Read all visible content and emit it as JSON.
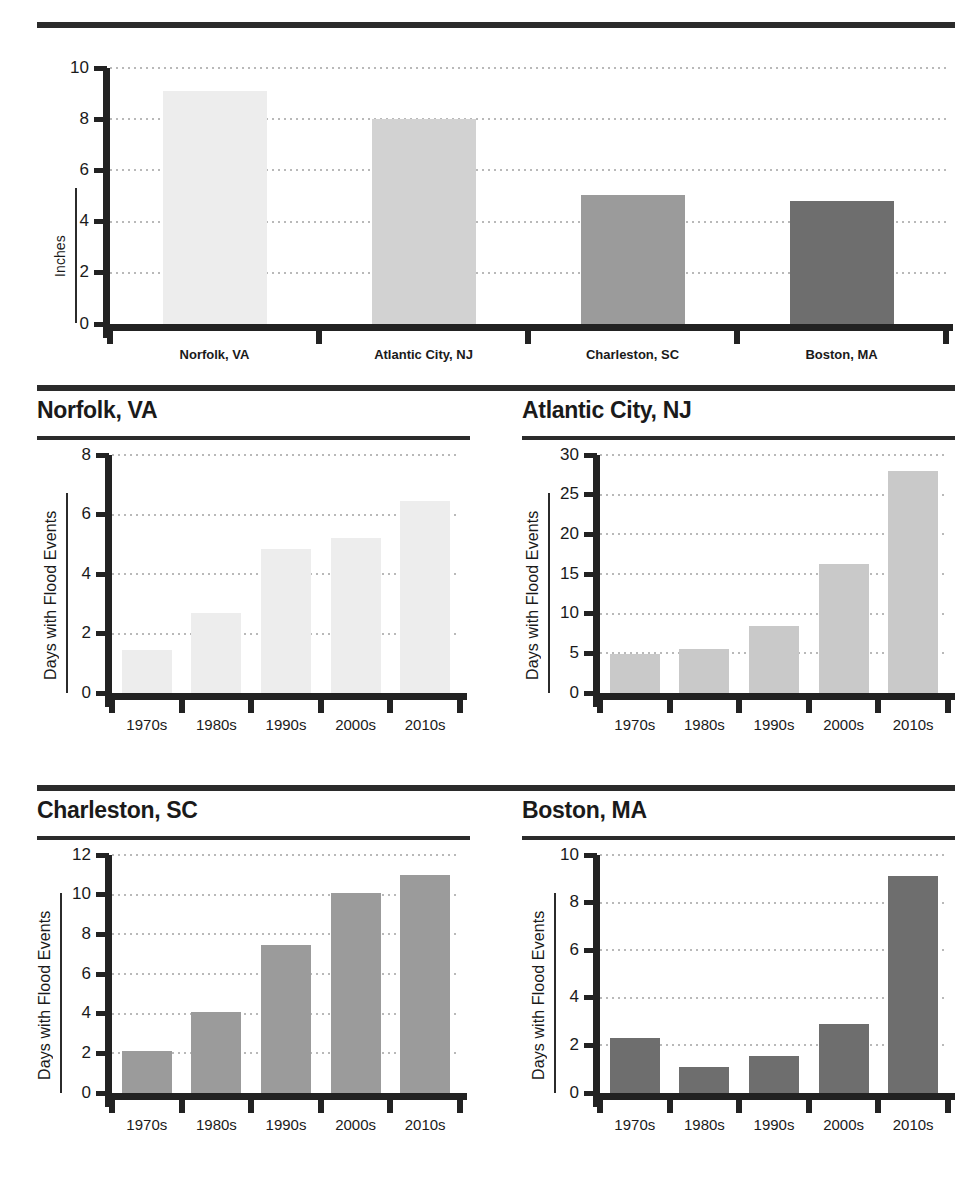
{
  "figure": {
    "top_rule_color": "#2b2b2b",
    "decade_labels": [
      "1970s",
      "1980s",
      "1990s",
      "2000s",
      "2010s"
    ],
    "axis_label_days": "Days with Flood Events",
    "axis_label_inches": "Inches"
  },
  "chart_data": [
    {
      "type": "bar",
      "title": "",
      "xlabel": "",
      "ylabel": "Inches",
      "categories": [
        "Norfolk, VA",
        "Atlantic City, NJ",
        "Charleston, SC",
        "Boston, MA"
      ],
      "values": [
        9.1,
        8.0,
        5.05,
        4.8
      ],
      "ylim": [
        0,
        10
      ],
      "yticks": [
        0,
        2,
        4,
        6,
        8,
        10
      ],
      "ytick_labels": [
        "0",
        "2",
        "4",
        "6",
        "8",
        "10"
      ],
      "colors": [
        "#ededed",
        "#d2d2d2",
        "#9b9b9b",
        "#6e6e6e"
      ],
      "grid": true,
      "legend": "none"
    },
    {
      "type": "bar",
      "title": "Norfolk, VA",
      "xlabel": "",
      "ylabel": "Days with Flood Events",
      "categories": [
        "1970s",
        "1980s",
        "1990s",
        "2000s",
        "2010s"
      ],
      "values": [
        1.45,
        2.7,
        4.85,
        5.2,
        6.45
      ],
      "ylim": [
        0,
        8
      ],
      "yticks": [
        0,
        2,
        4,
        6,
        8
      ],
      "ytick_labels": [
        "0",
        "2",
        "4",
        "6",
        "8"
      ],
      "color": "#ededed",
      "grid": true,
      "legend": "none"
    },
    {
      "type": "bar",
      "title": "Atlantic City, NJ",
      "xlabel": "",
      "ylabel": "Days with Flood Events",
      "categories": [
        "1970s",
        "1980s",
        "1990s",
        "2000s",
        "2010s"
      ],
      "values": [
        4.9,
        5.5,
        8.4,
        16.3,
        28.0
      ],
      "ylim": [
        0,
        30
      ],
      "yticks": [
        0,
        5,
        10,
        15,
        20,
        25,
        30
      ],
      "ytick_labels": [
        "0",
        "5",
        "10",
        "15",
        "20",
        "25",
        "30"
      ],
      "color": "#c9c9c9",
      "grid": true,
      "legend": "none"
    },
    {
      "type": "bar",
      "title": "Charleston, SC",
      "xlabel": "",
      "ylabel": "Days with Flood Events",
      "categories": [
        "1970s",
        "1980s",
        "1990s",
        "2000s",
        "2010s"
      ],
      "values": [
        2.1,
        4.1,
        7.45,
        10.1,
        11.0
      ],
      "ylim": [
        0,
        12
      ],
      "yticks": [
        0,
        2,
        4,
        6,
        8,
        10,
        12
      ],
      "ytick_labels": [
        "0",
        "2",
        "4",
        "6",
        "8",
        "10",
        "12"
      ],
      "color": "#9b9b9b",
      "grid": true,
      "legend": "none"
    },
    {
      "type": "bar",
      "title": "Boston, MA",
      "xlabel": "",
      "ylabel": "Days with Flood Events",
      "categories": [
        "1970s",
        "1980s",
        "1990s",
        "2000s",
        "2010s"
      ],
      "values": [
        2.3,
        1.1,
        1.55,
        2.9,
        9.1
      ],
      "ylim": [
        0,
        10
      ],
      "yticks": [
        0,
        2,
        4,
        6,
        8,
        10
      ],
      "ytick_labels": [
        "0",
        "2",
        "4",
        "6",
        "8",
        "10"
      ],
      "color": "#6e6e6e",
      "grid": true,
      "legend": "none"
    }
  ]
}
